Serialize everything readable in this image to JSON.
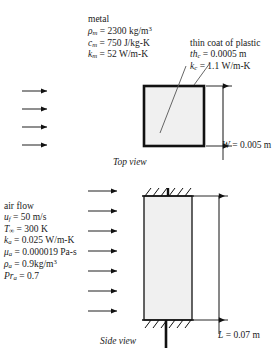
{
  "figure": {
    "type": "engineering-schematic",
    "box_fill": "#f0f0f0",
    "stroke": "#111111"
  },
  "metal": {
    "heading": "metal",
    "properties": [
      {
        "symbol": "ρ",
        "sub": "m",
        "value": "2300",
        "unit": "kg/m",
        "sup": "3"
      },
      {
        "symbol": "c",
        "sub": "m",
        "value": "750",
        "unit": "J/kg-K",
        "sup": ""
      },
      {
        "symbol": "k",
        "sub": "m",
        "value": "52",
        "unit": "W/m-K",
        "sup": ""
      }
    ]
  },
  "plastic": {
    "heading": "thin coat of plastic",
    "properties": [
      {
        "symbol": "th",
        "sub": "c",
        "value": "0.0005",
        "unit": "m",
        "sup": ""
      },
      {
        "symbol": "k",
        "sub": "c",
        "value": "1.1",
        "unit": "W/m-K",
        "sup": ""
      }
    ]
  },
  "airflow": {
    "heading": "air flow",
    "properties": [
      {
        "symbol": "u",
        "sub": "f",
        "value": "50",
        "unit": "m/s",
        "sup": ""
      },
      {
        "symbol": "T",
        "sub": "∞",
        "value": "300",
        "unit": "K",
        "sup": ""
      },
      {
        "symbol": "k",
        "sub": "a",
        "value": "0.025",
        "unit": "W/m-K",
        "sup": ""
      },
      {
        "symbol": "μ",
        "sub": "a",
        "value": "0.000019",
        "unit": "Pa-s",
        "sup": ""
      },
      {
        "symbol": "ρ",
        "sub": "a",
        "value": "0.9",
        "unit": "kg/m",
        "sup": "3"
      },
      {
        "symbol": "Pr",
        "sub": "a",
        "value": "0.7",
        "unit": "",
        "sup": ""
      }
    ]
  },
  "views": {
    "top_caption": "Top view",
    "side_caption": "Side view"
  },
  "dimensions": {
    "width": {
      "symbol": "W",
      "value": "0.005",
      "unit": "m"
    },
    "length": {
      "symbol": "L",
      "value": "0.07",
      "unit": "m"
    }
  },
  "arrows": {
    "top_view_count": 4,
    "side_view_count": 7
  }
}
